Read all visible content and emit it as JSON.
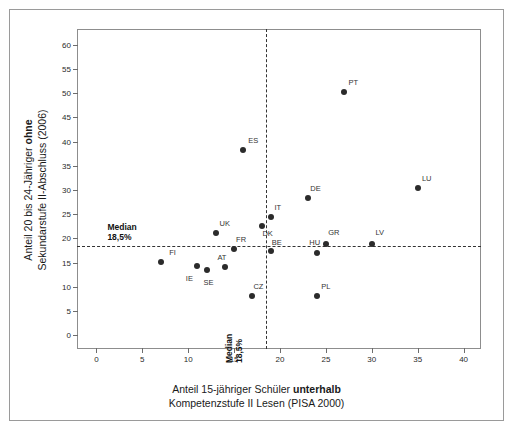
{
  "chart_data": {
    "type": "scatter",
    "title": "",
    "xlabel": "Anteil 15-jähriger Schüler unterhalb Kompetenzstufe II Lesen (PISA 2000)",
    "xlabel_line1_pre": "Anteil 15-jähriger Schüler ",
    "xlabel_line1_bold": "unterhalb",
    "xlabel_line2": "Kompetenzstufe II Lesen (PISA 2000)",
    "ylabel": "Anteil 20 bis 24-Jähriger ohne Sekundarstufe II-Abschluss (2006)",
    "ylabel_line1_pre": "Anteil 20 bis 24-Jähriger ",
    "ylabel_line1_bold": "ohne",
    "ylabel_line2": "Sekundarstufe II-Abschluss (2006)",
    "xlim": [
      -2,
      42
    ],
    "ylim": [
      -3,
      63
    ],
    "xticks": [
      0,
      5,
      10,
      15,
      20,
      25,
      30,
      35,
      40
    ],
    "yticks": [
      0,
      5,
      10,
      15,
      20,
      25,
      30,
      35,
      40,
      45,
      50,
      55,
      60
    ],
    "xtick_labels": [
      "0",
      "5",
      "10",
      "15",
      "20",
      "25",
      "30",
      "35",
      "40"
    ],
    "ytick_labels": [
      "0",
      "5",
      "10",
      "15",
      "20",
      "25",
      "30",
      "35",
      "40",
      "45",
      "50",
      "55",
      "60"
    ],
    "grid": false,
    "legend": "none",
    "point_color": "#2b2b2b",
    "reference_lines": [
      {
        "name": "median-horizontal",
        "orientation": "horizontal",
        "value": 18.5,
        "label_line1": "Median",
        "label_line2": "18,5%",
        "style": "dashed"
      },
      {
        "name": "median-vertical",
        "orientation": "vertical",
        "value": 18.5,
        "label_line1": "Median",
        "label_line2": "18,5%",
        "style": "dashed"
      }
    ],
    "points": [
      {
        "label": "FI",
        "x": 7.0,
        "y": 15.2,
        "lx": 12,
        "ly": -5
      },
      {
        "label": "IE",
        "x": 11.0,
        "y": 14.3,
        "lx": -8,
        "ly": 17
      },
      {
        "label": "SE",
        "x": 12.0,
        "y": 13.5,
        "lx": 2,
        "ly": 17
      },
      {
        "label": "UK",
        "x": 13.0,
        "y": 21.1,
        "lx": 9,
        "ly": -5
      },
      {
        "label": "AT",
        "x": 14.0,
        "y": 14.1,
        "lx": -3,
        "ly": -5
      },
      {
        "label": "FR",
        "x": 15.0,
        "y": 17.8,
        "lx": 7,
        "ly": -5
      },
      {
        "label": "ES",
        "x": 16.0,
        "y": 38.3,
        "lx": 10,
        "ly": -5
      },
      {
        "label": "CZ",
        "x": 17.0,
        "y": 8.2,
        "lx": 6,
        "ly": -5
      },
      {
        "label": "DK",
        "x": 18.0,
        "y": 22.5,
        "lx": 6,
        "ly": 12
      },
      {
        "label": "IT",
        "x": 19.0,
        "y": 24.4,
        "lx": 7,
        "ly": -5
      },
      {
        "label": "BE",
        "x": 19.0,
        "y": 17.5,
        "lx": 6,
        "ly": -4
      },
      {
        "label": "DE",
        "x": 23.0,
        "y": 28.3,
        "lx": 8,
        "ly": -5
      },
      {
        "label": "HU",
        "x": 24.0,
        "y": 17.0,
        "lx": -2,
        "ly": -6
      },
      {
        "label": "PL",
        "x": 24.0,
        "y": 8.2,
        "lx": 9,
        "ly": -5
      },
      {
        "label": "GR",
        "x": 25.0,
        "y": 18.8,
        "lx": 8,
        "ly": -7
      },
      {
        "label": "PT",
        "x": 27.0,
        "y": 50.3,
        "lx": 9,
        "ly": -5
      },
      {
        "label": "LV",
        "x": 30.0,
        "y": 18.9,
        "lx": 8,
        "ly": -7
      },
      {
        "label": "LU",
        "x": 35.0,
        "y": 30.5,
        "lx": 9,
        "ly": -5
      }
    ]
  }
}
